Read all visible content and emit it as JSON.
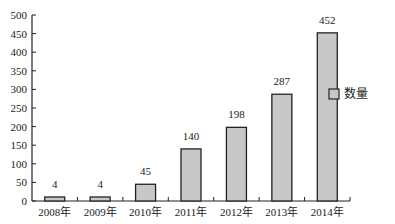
{
  "chart_data": {
    "type": "bar",
    "title": "",
    "xlabel": "",
    "ylabel": "",
    "categories": [
      "2008年",
      "2009年",
      "2010年",
      "2011年",
      "2012年",
      "2013年",
      "2014年"
    ],
    "series": [
      {
        "name": "数量",
        "values": [
          4,
          4,
          45,
          140,
          198,
          287,
          452
        ],
        "color": "#c8c8c8",
        "edge_color": "#222222"
      }
    ],
    "data_labels": [
      "4",
      "4",
      "45",
      "140",
      "198",
      "287",
      "452"
    ],
    "ylim": [
      0,
      500
    ],
    "yticks": [
      0,
      50,
      100,
      150,
      200,
      250,
      300,
      350,
      400,
      450,
      500
    ],
    "grid": false,
    "legend": {
      "position": "right",
      "entries": [
        "数量"
      ]
    }
  }
}
